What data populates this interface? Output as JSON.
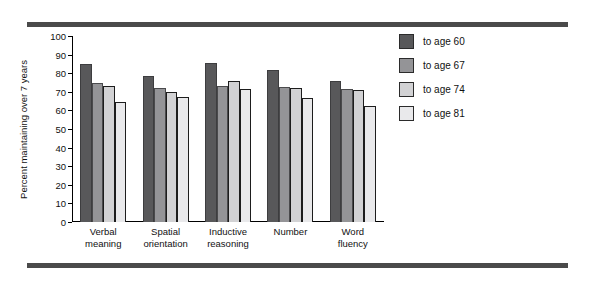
{
  "chart_data": {
    "type": "bar",
    "title": "",
    "xlabel": "",
    "ylabel": "Percent maintaining over 7 years",
    "ylim": [
      0,
      100
    ],
    "yticks": [
      0,
      10,
      20,
      30,
      40,
      50,
      60,
      70,
      80,
      90,
      100
    ],
    "grid": false,
    "legend_position": "right",
    "categories": [
      "Verbal\nmeaning",
      "Spatial\norientation",
      "Inductive\nreasoning",
      "Number",
      "Word\nfluency"
    ],
    "category_lines": [
      [
        "Verbal",
        "meaning"
      ],
      [
        "Spatial",
        "orientation"
      ],
      [
        "Inductive",
        "reasoning"
      ],
      [
        "Number",
        ""
      ],
      [
        "Word",
        "fluency"
      ]
    ],
    "series": [
      {
        "name": "to age 60",
        "color": "#58585a",
        "values": [
          85,
          78.5,
          85.5,
          81.5,
          76
        ]
      },
      {
        "name": "to age 67",
        "color": "#949497",
        "values": [
          75,
          72,
          73,
          72.5,
          71.5
        ]
      },
      {
        "name": "to age 74",
        "color": "#d2d2d4",
        "values": [
          73,
          70,
          76,
          72,
          71
        ]
      },
      {
        "name": "to age 81",
        "color": "#e9e9eb",
        "values": [
          64.5,
          67,
          71.5,
          66.5,
          62.5
        ]
      }
    ]
  },
  "legend": {
    "items": [
      {
        "label": "to age 60"
      },
      {
        "label": "to age 67"
      },
      {
        "label": "to age 74"
      },
      {
        "label": "to age 81"
      }
    ]
  },
  "decoration": {
    "rule_color": "#4a4a4a"
  }
}
